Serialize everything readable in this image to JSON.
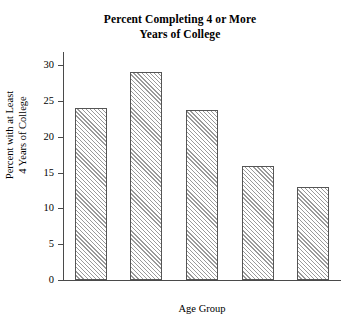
{
  "chart_data": {
    "type": "bar",
    "title": "Percent Completing 4 or More Years of College",
    "title_lines": [
      "Percent Completing 4 or More",
      "Years of College"
    ],
    "categories": [
      "25–34",
      "35–44",
      "45–54",
      "55–64",
      "over 65"
    ],
    "values": [
      24,
      29,
      23.7,
      16,
      13
    ],
    "xlabel": "Age Group",
    "ylabel": "Percent with at Least 4 Years of College",
    "ylabel_lines": [
      "Percent with at Least",
      "4 Years of College"
    ],
    "ylim": [
      0,
      32
    ],
    "yticks": [
      0,
      5,
      10,
      15,
      20,
      25,
      30
    ],
    "ytick_labels": [
      "0",
      "5",
      "10",
      "15",
      "20",
      "25",
      "30"
    ],
    "grid": false,
    "legend": false,
    "bar_fill": "hatched-diagonal",
    "bar_edge_color": "#555555",
    "hatch_color": "#9a9a9a",
    "background_color": "#ffffff"
  }
}
